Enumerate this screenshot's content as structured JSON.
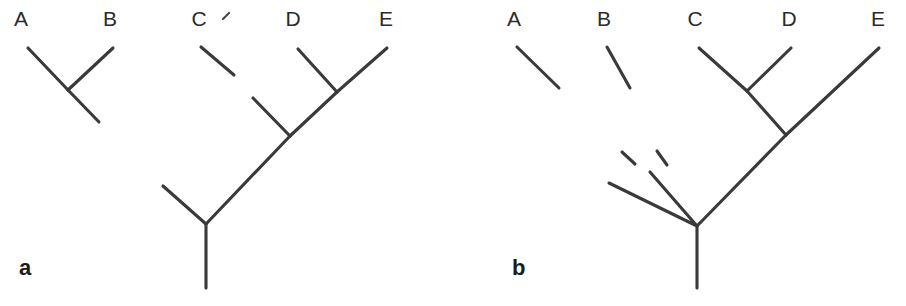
{
  "figure": {
    "background_color": "#ffffff",
    "line_color": "#3a3a3a",
    "text_color": "#2b2b2b"
  },
  "panels": [
    {
      "id": "a",
      "label": "a",
      "label_x": 19,
      "label_y": 275,
      "taxa": [
        {
          "name": "A",
          "x": 21,
          "y": 26
        },
        {
          "name": "B",
          "x": 110,
          "y": 26
        },
        {
          "name": "C",
          "x": 199,
          "y": 26
        },
        {
          "name": "D",
          "x": 293,
          "y": 26
        },
        {
          "name": "E",
          "x": 386,
          "y": 26
        }
      ],
      "artifacts": [
        {
          "name": "tick-after-c",
          "x1": 223,
          "y1": 19,
          "x2": 229,
          "y2": 13
        }
      ],
      "branches": [
        {
          "name": "branch-a",
          "x1": 28,
          "y1": 48,
          "x2": 68,
          "y2": 90
        },
        {
          "name": "branch-b",
          "x1": 113,
          "y1": 48,
          "x2": 68,
          "y2": 90
        },
        {
          "name": "branch-ab-stem",
          "x1": 68,
          "y1": 90,
          "x2": 99,
          "y2": 122
        },
        {
          "name": "branch-c-fragment",
          "x1": 201,
          "y1": 47,
          "x2": 234,
          "y2": 75
        },
        {
          "name": "branch-d",
          "x1": 298,
          "y1": 49,
          "x2": 337,
          "y2": 92
        },
        {
          "name": "branch-e",
          "x1": 387,
          "y1": 48,
          "x2": 337,
          "y2": 92
        },
        {
          "name": "branch-de-stem",
          "x1": 337,
          "y1": 92,
          "x2": 290,
          "y2": 136
        },
        {
          "name": "branch-inner-left",
          "x1": 253,
          "y1": 98,
          "x2": 290,
          "y2": 136
        },
        {
          "name": "branch-cde-stem",
          "x1": 290,
          "y1": 136,
          "x2": 206,
          "y2": 224
        },
        {
          "name": "branch-root-left",
          "x1": 163,
          "y1": 186,
          "x2": 206,
          "y2": 224
        },
        {
          "name": "branch-root-stem",
          "x1": 206,
          "y1": 224,
          "x2": 206,
          "y2": 288
        }
      ]
    },
    {
      "id": "b",
      "label": "b",
      "label_x": 512,
      "label_y": 275,
      "taxa": [
        {
          "name": "A",
          "x": 514,
          "y": 26
        },
        {
          "name": "B",
          "x": 604,
          "y": 26
        },
        {
          "name": "C",
          "x": 695,
          "y": 26
        },
        {
          "name": "D",
          "x": 789,
          "y": 26
        },
        {
          "name": "E",
          "x": 878,
          "y": 26
        }
      ],
      "artifacts": [],
      "branches": [
        {
          "name": "branch-a-fragment",
          "x1": 517,
          "y1": 47,
          "x2": 559,
          "y2": 88
        },
        {
          "name": "branch-b-fragment",
          "x1": 607,
          "y1": 47,
          "x2": 630,
          "y2": 88
        },
        {
          "name": "branch-a-dash",
          "x1": 622,
          "y1": 152,
          "x2": 635,
          "y2": 164
        },
        {
          "name": "branch-b-dash",
          "x1": 657,
          "y1": 151,
          "x2": 667,
          "y2": 165
        },
        {
          "name": "branch-a-lower",
          "x1": 609,
          "y1": 183,
          "x2": 697,
          "y2": 226
        },
        {
          "name": "branch-b-lower",
          "x1": 650,
          "y1": 172,
          "x2": 697,
          "y2": 226
        },
        {
          "name": "branch-c",
          "x1": 699,
          "y1": 48,
          "x2": 747,
          "y2": 91
        },
        {
          "name": "branch-d",
          "x1": 791,
          "y1": 48,
          "x2": 747,
          "y2": 91
        },
        {
          "name": "branch-cd-stem",
          "x1": 747,
          "y1": 91,
          "x2": 786,
          "y2": 135
        },
        {
          "name": "branch-e",
          "x1": 879,
          "y1": 48,
          "x2": 786,
          "y2": 135
        },
        {
          "name": "branch-cde-stem",
          "x1": 786,
          "y1": 135,
          "x2": 697,
          "y2": 226
        },
        {
          "name": "branch-root-stem",
          "x1": 697,
          "y1": 226,
          "x2": 697,
          "y2": 288
        }
      ]
    }
  ]
}
